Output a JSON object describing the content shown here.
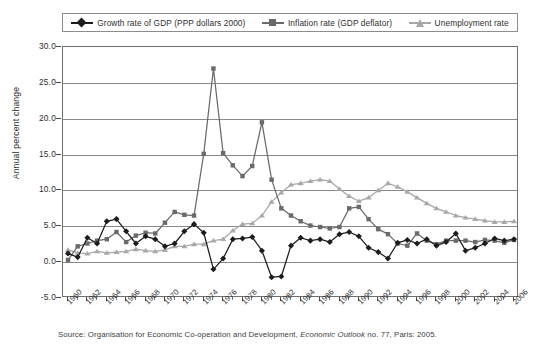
{
  "chart_data": {
    "type": "line",
    "title": "",
    "xlabel": "",
    "ylabel": "Annual percent change",
    "xlim": [
      1960,
      2006
    ],
    "ylim": [
      -5.0,
      30.0
    ],
    "yticks": [
      30.0,
      25.0,
      20.0,
      15.0,
      10.0,
      5.0,
      0.0,
      -5.0
    ],
    "ytick_labels": [
      "30.0",
      "25.0",
      "20.0",
      "15.0",
      "10.0",
      "5.0",
      "0.0",
      "-5.0"
    ],
    "grid": true,
    "legend_position": "top",
    "x": [
      1960,
      1961,
      1962,
      1963,
      1964,
      1965,
      1966,
      1967,
      1968,
      1969,
      1970,
      1971,
      1972,
      1973,
      1974,
      1975,
      1976,
      1977,
      1978,
      1979,
      1980,
      1981,
      1982,
      1983,
      1984,
      1985,
      1986,
      1987,
      1988,
      1989,
      1990,
      1991,
      1992,
      1993,
      1994,
      1995,
      1996,
      1997,
      1998,
      1999,
      2000,
      2001,
      2002,
      2003,
      2004,
      2005,
      2006
    ],
    "xtick_labels": [
      "1960",
      "1962",
      "1964",
      "1966",
      "1968",
      "1970",
      "1972",
      "1974",
      "1976",
      "1978",
      "1980",
      "1982",
      "1984",
      "1986",
      "1988",
      "1990",
      "1992",
      "1994",
      "1996",
      "1998",
      "2000",
      "2002",
      "2004",
      "2006"
    ],
    "series": [
      {
        "name": "Growth rate of GDP (PPP dollars 2000)",
        "color": "#1c1c1c",
        "marker": "diamond",
        "values": [
          1.2,
          0.7,
          3.4,
          2.6,
          5.7,
          6.0,
          4.3,
          2.6,
          3.6,
          3.2,
          2.2,
          2.6,
          4.3,
          5.3,
          4.1,
          -1.0,
          0.5,
          3.2,
          3.3,
          3.5,
          1.6,
          -2.1,
          -2.0,
          2.3,
          3.4,
          3.0,
          3.2,
          2.8,
          3.9,
          4.2,
          3.6,
          2.0,
          1.4,
          0.5,
          2.7,
          3.1,
          2.6,
          3.2,
          2.3,
          2.8,
          4.0,
          1.6,
          2.0,
          2.6,
          3.3,
          3.0,
          3.2
        ]
      },
      {
        "name": "Inflation rate (GDP deflator)",
        "color": "#6a6a6a",
        "marker": "square",
        "values": [
          0.3,
          2.2,
          2.6,
          3.0,
          3.2,
          4.2,
          2.8,
          3.7,
          4.1,
          4.0,
          5.5,
          7.0,
          6.6,
          6.5,
          15.1,
          27.0,
          15.2,
          13.5,
          12.0,
          13.4,
          19.5,
          11.5,
          7.5,
          6.5,
          5.7,
          5.1,
          4.9,
          4.7,
          4.9,
          7.5,
          7.7,
          6.0,
          4.6,
          3.9,
          2.6,
          2.3,
          4.0,
          3.0,
          2.5,
          3.0,
          3.0,
          3.0,
          2.8,
          3.1,
          3.0,
          2.7,
          3.1
        ]
      },
      {
        "name": "Unemployment rate",
        "color": "#a8a8a8",
        "marker": "triangle",
        "values": [
          1.7,
          1.3,
          1.2,
          1.5,
          1.3,
          1.4,
          1.5,
          1.8,
          1.6,
          1.5,
          1.7,
          2.2,
          2.2,
          2.5,
          2.5,
          3.0,
          3.2,
          4.4,
          5.3,
          5.4,
          6.5,
          8.4,
          9.7,
          10.8,
          11.0,
          11.3,
          11.5,
          11.3,
          10.2,
          9.2,
          8.5,
          9.0,
          10.0,
          11.0,
          10.5,
          9.8,
          9.0,
          8.2,
          7.5,
          7.0,
          6.5,
          6.2,
          6.0,
          5.8,
          5.6,
          5.6,
          5.7
        ]
      }
    ],
    "annotations": {
      "source": "Source: Organisation for Economic Co-operation and Development, ",
      "source_italic": "Economic Outlook",
      "source_tail": " no. 77, Paris: 2005."
    }
  },
  "legend": {
    "items": [
      {
        "label": "Growth rate of GDP (PPP dollars 2000)",
        "marker": "diamond-marker-icon",
        "color": "#1c1c1c"
      },
      {
        "label": "Inflation rate (GDP deflator)",
        "marker": "square-marker-icon",
        "color": "#6a6a6a"
      },
      {
        "label": "Unemployment rate",
        "marker": "triangle-marker-icon",
        "color": "#a8a8a8"
      }
    ]
  }
}
